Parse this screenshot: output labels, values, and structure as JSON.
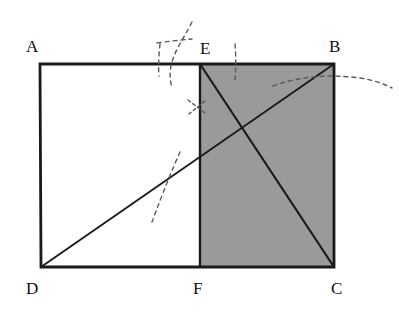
{
  "figure": {
    "name": "rectangle-with-shaded-subrectangle-and-diagonals",
    "canvas": {
      "width": 399,
      "height": 317
    },
    "background_color": "#ffffff",
    "stroke_color": "#1a1a1a",
    "shade_color": "#9a9a9a",
    "annotation_color": "#555555",
    "points": {
      "A": {
        "label": "A",
        "x": 40,
        "y": 64
      },
      "B": {
        "label": "B",
        "x": 334,
        "y": 64
      },
      "C": {
        "label": "C",
        "x": 334,
        "y": 267
      },
      "D": {
        "label": "D",
        "x": 41,
        "y": 267
      },
      "E": {
        "label": "E",
        "x": 200,
        "y": 64
      },
      "F": {
        "label": "F",
        "x": 200,
        "y": 267
      }
    },
    "labels": {
      "A": "A",
      "B": "B",
      "C": "C",
      "D": "D",
      "E": "E",
      "F": "F"
    },
    "segments": [
      {
        "name": "side-AB",
        "from": "A",
        "to": "B"
      },
      {
        "name": "side-BC",
        "from": "B",
        "to": "C"
      },
      {
        "name": "side-CD",
        "from": "C",
        "to": "D"
      },
      {
        "name": "side-DA",
        "from": "D",
        "to": "A"
      },
      {
        "name": "divider-EF",
        "from": "E",
        "to": "F"
      },
      {
        "name": "diagonal-DB",
        "from": "D",
        "to": "B"
      },
      {
        "name": "diagonal-EC",
        "from": "E",
        "to": "C"
      }
    ],
    "shaded_region": {
      "name": "region-EBCF",
      "vertices": [
        "E",
        "B",
        "C",
        "F"
      ],
      "fill": "#9a9a9a"
    },
    "annotations": [
      {
        "name": "pencil-mark-above-E",
        "style": "dashed-arc"
      },
      {
        "name": "pencil-cross-near-E",
        "style": "dashed-cross"
      },
      {
        "name": "pencil-tick-right-of-E",
        "style": "dashed-vertical"
      },
      {
        "name": "pencil-cross-on-EF",
        "style": "dashed-cross"
      },
      {
        "name": "pencil-cross-on-DB",
        "style": "dashed-line"
      },
      {
        "name": "pencil-curve-from-B",
        "style": "dashed-curve"
      }
    ]
  }
}
